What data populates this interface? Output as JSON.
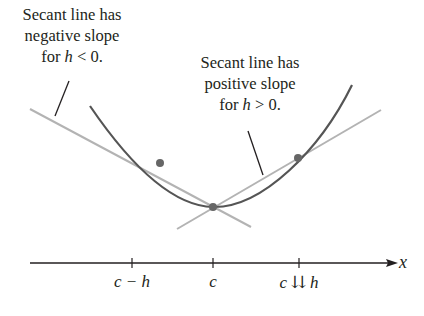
{
  "diagram": {
    "annotations": {
      "left": {
        "line1": "Secant line has",
        "line2": "negative slope",
        "line3_prefix": "for ",
        "line3_var": "h",
        "line3_suffix": " < 0."
      },
      "right": {
        "line1": "Secant line has",
        "line2": "positive slope",
        "line3_prefix": "for ",
        "line3_var": "h",
        "line3_suffix": " > 0."
      }
    },
    "axis": {
      "label": "x",
      "ticks": [
        "c − h",
        "c",
        "c ⇊ h"
      ]
    },
    "colors": {
      "curve": "#555555",
      "secant_lines": "#b3b3b3",
      "points": "#666666",
      "axis": "#231f20",
      "pointer": "#231f20"
    }
  }
}
